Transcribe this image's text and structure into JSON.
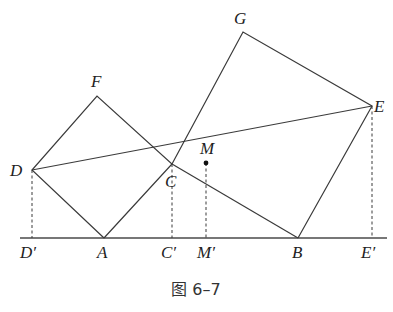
{
  "caption": "图 6–7",
  "points": {
    "D": {
      "label": "D",
      "x": 32,
      "y": 170
    },
    "F": {
      "label": "F",
      "x": 97,
      "y": 96
    },
    "A": {
      "label": "A",
      "x": 104,
      "y": 238
    },
    "C": {
      "label": "C",
      "x": 172,
      "y": 164
    },
    "M": {
      "label": "M",
      "x": 206,
      "y": 163
    },
    "G": {
      "label": "G",
      "x": 243,
      "y": 32
    },
    "E": {
      "label": "E",
      "x": 372,
      "y": 106
    },
    "B": {
      "label": "B",
      "x": 298,
      "y": 238
    },
    "Dp": {
      "label": "D′",
      "x": 32,
      "y": 238
    },
    "Cp": {
      "label": "C′",
      "x": 172,
      "y": 238
    },
    "Mp": {
      "label": "M′",
      "x": 206,
      "y": 238
    },
    "Ep": {
      "label": "E′",
      "x": 372,
      "y": 238
    }
  },
  "labels": {
    "D": "D",
    "F": "F",
    "A": "A",
    "C": "C",
    "M": "M",
    "G": "G",
    "E": "E",
    "B": "B",
    "Dp": "D′",
    "Cp": "C′",
    "Mp": "M′",
    "Ep": "E′"
  },
  "shapes": {
    "square_ADFC": [
      "A",
      "D",
      "F",
      "C"
    ],
    "square_BCGE": [
      "C",
      "G",
      "E",
      "B"
    ],
    "segment_DE": [
      "D",
      "E"
    ],
    "perpendiculars": [
      "DD′",
      "CC′",
      "MM′",
      "EE′"
    ],
    "baseline": [
      "D′",
      "E′"
    ]
  }
}
